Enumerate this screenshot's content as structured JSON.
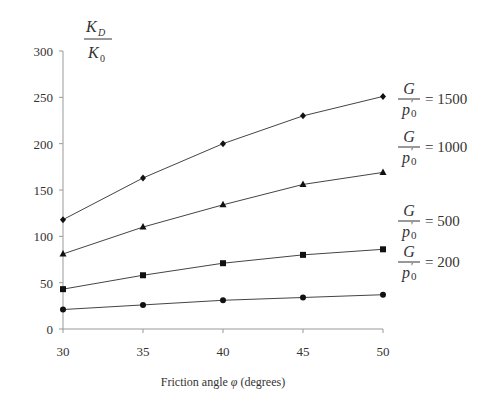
{
  "chart_data": {
    "type": "line",
    "title": "",
    "xlabel": "Friction angle φ (degrees)",
    "ylabel": "K_D / K_0",
    "x": [
      30,
      35,
      40,
      45,
      50
    ],
    "xlim": [
      30,
      50
    ],
    "ylim": [
      0,
      300
    ],
    "xticks": [
      "30",
      "35",
      "40",
      "45",
      "50"
    ],
    "yticks": [
      "0",
      "50",
      "100",
      "150",
      "200",
      "250",
      "300"
    ],
    "grid": false,
    "legend_position": "right, inline labels",
    "series": [
      {
        "name": "G/p'0 = 1500",
        "value_label": "= 1500",
        "marker": "diamond",
        "values": [
          118,
          163,
          200,
          230,
          251
        ]
      },
      {
        "name": "G/p'0 = 1000",
        "value_label": "= 1000",
        "marker": "triangle",
        "values": [
          81,
          110,
          134,
          156,
          169
        ]
      },
      {
        "name": "G/p'0 = 500",
        "value_label": "= 500",
        "marker": "square",
        "values": [
          43,
          58,
          71,
          80,
          86
        ]
      },
      {
        "name": "G/p'0 = 200",
        "value_label": "= 200",
        "marker": "circle",
        "values": [
          21,
          26,
          31,
          34,
          37
        ]
      }
    ]
  },
  "labels": {
    "ylabel_num": "K",
    "ylabel_num_sub": "D",
    "ylabel_den": "K",
    "ylabel_den_sub": "0",
    "legend_num": "G",
    "legend_den": "p",
    "legend_den_sub": "0",
    "legend_prime": "′",
    "xlabel_pre": "Friction angle ",
    "xlabel_sym": "φ",
    "xlabel_post": " (degrees)"
  }
}
